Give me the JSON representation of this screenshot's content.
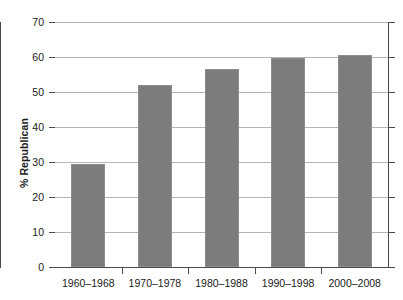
{
  "chart_data": {
    "type": "bar",
    "title": "",
    "subtitle": "",
    "xlabel": "",
    "ylabel": "% Republican",
    "categories": [
      "1960–1968",
      "1970–1978",
      "1980–1988",
      "1990–1998",
      "2000–2008"
    ],
    "values": [
      29.4,
      52.0,
      56.6,
      59.7,
      60.5
    ],
    "ylim": [
      0,
      70
    ],
    "ytick_interval": 10,
    "ytick_labels": [
      "0",
      "10",
      "20",
      "30",
      "40",
      "50",
      "60",
      "70"
    ],
    "grid": "horizontal",
    "legend": "none",
    "bar_color": "#7b7b7b",
    "gridline_color": "#b4b4b4",
    "axis_color": "#4a4a4a",
    "background_color": "#ffffff"
  }
}
